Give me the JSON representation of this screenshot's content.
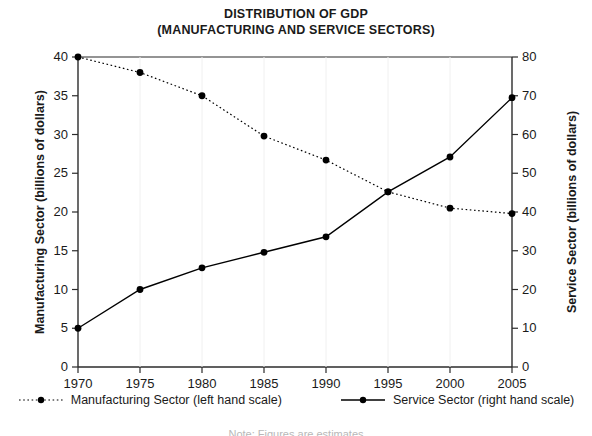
{
  "title": {
    "line1": "DISTRIBUTION OF GDP",
    "line2": "(MANUFACTURING AND SERVICE SECTORS)"
  },
  "note": "Note: Figures are estimates",
  "legend": [
    {
      "label": "Manufacturing Sector (left hand scale)",
      "style": "dotted",
      "marker": "filled-circle",
      "color": "#000000"
    },
    {
      "label": "Service Sector (right hand scale)",
      "style": "solid",
      "marker": "filled-circle",
      "color": "#000000"
    }
  ],
  "chart_data": {
    "type": "line",
    "title": "DISTRIBUTION OF GDP (MANUFACTURING AND SERVICE SECTORS)",
    "xlabel": "",
    "x": [
      1970,
      1975,
      1980,
      1985,
      1990,
      1995,
      2000,
      2005
    ],
    "xtick_labels": [
      "1970",
      "1975",
      "1980",
      "1985",
      "1990",
      "1995",
      "2000",
      "2005"
    ],
    "xlim": [
      1970,
      2005
    ],
    "grid": false,
    "legend_position": "bottom",
    "series": [
      {
        "name": "Manufacturing Sector (left hand scale)",
        "axis": "left",
        "linestyle": "dotted",
        "marker": "filled-circle",
        "color": "#000000",
        "values": [
          40.0,
          38.0,
          35.0,
          29.8,
          26.7,
          22.6,
          20.5,
          19.8
        ]
      },
      {
        "name": "Service Sector (right hand scale)",
        "axis": "right",
        "linestyle": "solid",
        "marker": "filled-circle",
        "color": "#000000",
        "values": [
          10.0,
          20.0,
          25.6,
          29.6,
          33.6,
          45.2,
          54.2,
          69.5
        ]
      }
    ],
    "axes": {
      "left": {
        "label": "Manufacturing Sector (billions of dollars)",
        "ylim": [
          0,
          40
        ],
        "tick_step": 5,
        "ticks": [
          0,
          5,
          10,
          15,
          20,
          25,
          30,
          35,
          40
        ],
        "tick_labels": [
          "0",
          "5",
          "10",
          "15",
          "20",
          "25",
          "30",
          "35",
          "40"
        ]
      },
      "right": {
        "label": "Service Sector (billions of dollars)",
        "ylim": [
          0,
          80
        ],
        "tick_step": 10,
        "ticks": [
          0,
          10,
          20,
          30,
          40,
          50,
          60,
          70,
          80
        ],
        "tick_labels": [
          "0",
          "10",
          "20",
          "30",
          "40",
          "50",
          "60",
          "70",
          "80"
        ]
      }
    }
  }
}
